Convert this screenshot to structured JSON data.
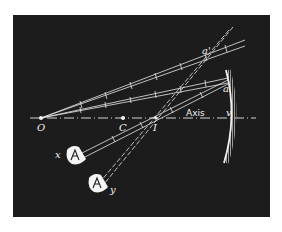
{
  "figure": {
    "background_color": "#1c1c1c",
    "line_color": "#e8e8e8"
  },
  "labels": {
    "object": "O",
    "center": "C",
    "image": "I",
    "axis": "Axis",
    "vertex": "v",
    "point_a": "a",
    "point_a_prime": "a'",
    "eye_x": "x",
    "eye_y": "y"
  },
  "points": {
    "O": [
      41,
      118
    ],
    "C": [
      123,
      118
    ],
    "I": [
      156,
      118
    ],
    "v": [
      236,
      118
    ],
    "a": [
      226,
      80
    ],
    "a_prime": [
      208,
      56
    ]
  },
  "mirror": {
    "top": [
      228,
      70
    ],
    "vertex": [
      237,
      118
    ],
    "bottom": [
      226,
      163
    ]
  }
}
